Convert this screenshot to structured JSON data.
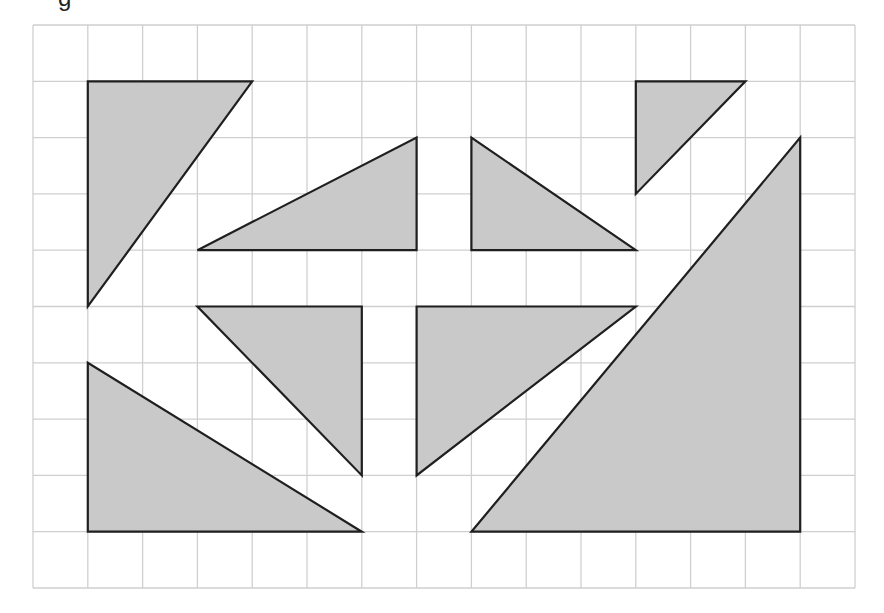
{
  "caption_fragment": "g",
  "grid": {
    "origin_x": 33,
    "origin_y": 25,
    "cell_w": 54.8,
    "cell_h": 56.3,
    "cols": 15,
    "rows": 10,
    "line_color": "#cfcfcf",
    "line_width": 1.3
  },
  "style": {
    "fill": "#c9c9c9",
    "stroke": "#1f1f1f",
    "stroke_width": 2.2
  },
  "shapes": [
    {
      "name": "triangle-top-left",
      "points": [
        [
          1,
          1
        ],
        [
          4,
          1
        ],
        [
          1,
          5
        ]
      ]
    },
    {
      "name": "triangle-upper-center-left",
      "points": [
        [
          3,
          4
        ],
        [
          7,
          2
        ],
        [
          7,
          4
        ]
      ]
    },
    {
      "name": "triangle-upper-center-right",
      "points": [
        [
          8,
          2
        ],
        [
          8,
          4
        ],
        [
          11,
          4
        ]
      ]
    },
    {
      "name": "triangle-top-right-small",
      "points": [
        [
          11,
          1
        ],
        [
          13,
          1
        ],
        [
          11,
          3
        ]
      ]
    },
    {
      "name": "triangle-lower-center-left",
      "points": [
        [
          3,
          5
        ],
        [
          6,
          5
        ],
        [
          6,
          8
        ]
      ]
    },
    {
      "name": "triangle-lower-center-right",
      "points": [
        [
          7,
          5
        ],
        [
          11,
          5
        ],
        [
          7,
          8
        ]
      ]
    },
    {
      "name": "triangle-bottom-left",
      "points": [
        [
          1,
          6
        ],
        [
          1,
          9
        ],
        [
          6,
          9
        ]
      ]
    },
    {
      "name": "triangle-bottom-right-large",
      "points": [
        [
          8,
          9
        ],
        [
          14,
          2
        ],
        [
          14,
          9
        ]
      ]
    }
  ]
}
